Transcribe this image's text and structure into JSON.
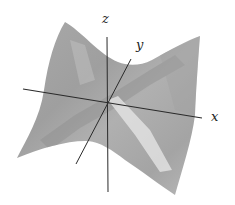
{
  "figure": {
    "surface": {
      "fill_color": "#a8a8a8",
      "shade_dark": "#8e8e8e",
      "highlight_color": "#e4e4e4",
      "outline_points": {
        "top_left_peak": [
          65,
          22
        ],
        "top_saddle": [
          130,
          63
        ],
        "top_right_peak": [
          200,
          36
        ],
        "right_edge_mid": [
          195,
          115
        ],
        "bottom_right_corner": [
          175,
          195
        ],
        "bottom_saddle": [
          90,
          143
        ],
        "bottom_left_corner": [
          17,
          158
        ],
        "left_edge_mid": [
          45,
          90
        ]
      }
    },
    "axes": {
      "color": "#2a2a2a",
      "origin": [
        107,
        102
      ],
      "x": {
        "label": "x",
        "from": [
          23,
          89
        ],
        "to": [
          202,
          118
        ]
      },
      "y": {
        "label": "y",
        "from": [
          76,
          164
        ],
        "to": [
          131,
          59
        ]
      },
      "z": {
        "label": "z",
        "from": [
          107,
          37
        ],
        "to": [
          108,
          192
        ]
      }
    }
  }
}
